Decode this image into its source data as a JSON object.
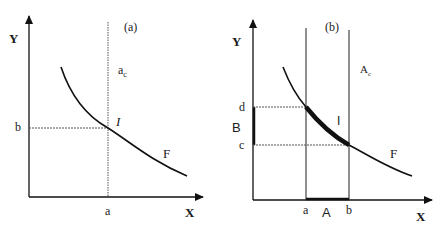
{
  "figure": {
    "panels": [
      {
        "id": "a",
        "panel_label": "(a)",
        "y_axis_label": "Y",
        "x_axis_label": "X",
        "x_tick": "a",
        "y_tick": "b",
        "vertical_line_label": "a",
        "vertical_line_subscript": "c",
        "point_label": "I",
        "curve_label": "F"
      },
      {
        "id": "b",
        "panel_label": "(b)",
        "y_axis_label": "Y",
        "x_axis_label": "X",
        "x_ticks": [
          "a",
          "b"
        ],
        "y_ticks": [
          "d",
          "c"
        ],
        "x_interval_label": "A",
        "y_interval_label": "B",
        "region_label": "A",
        "region_subscript": "c",
        "segment_label": "I",
        "curve_label": "F"
      }
    ]
  }
}
